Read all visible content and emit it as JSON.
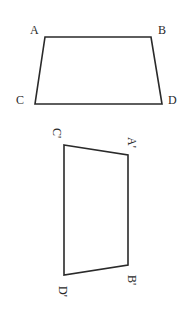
{
  "figure_top": {
    "shape": "trapezoid",
    "stroke_color": "#2a2a2a",
    "vertices": {
      "A": {
        "label": "A",
        "x": 45,
        "y": 37,
        "label_x": 30,
        "label_y": 34
      },
      "B": {
        "label": "B",
        "x": 151,
        "y": 37,
        "label_x": 158,
        "label_y": 34
      },
      "C": {
        "label": "C",
        "x": 35,
        "y": 104,
        "label_x": 16,
        "label_y": 104
      },
      "D": {
        "label": "D",
        "x": 162,
        "y": 104,
        "label_x": 168,
        "label_y": 104
      }
    }
  },
  "figure_bottom": {
    "shape": "trapezoid-rotated",
    "stroke_color": "#2a2a2a",
    "label_rotation_deg": 90,
    "vertices": {
      "C_prime": {
        "label": "C'",
        "x": 64,
        "y": 145,
        "label_x": 53,
        "label_y": 128
      },
      "A_prime": {
        "label": "A'",
        "x": 128,
        "y": 155,
        "label_x": 128,
        "label_y": 137
      },
      "B_prime": {
        "label": "B'",
        "x": 128,
        "y": 265,
        "label_x": 128,
        "label_y": 275
      },
      "D_prime": {
        "label": "D'",
        "x": 64,
        "y": 275,
        "label_x": 59,
        "label_y": 286
      }
    }
  }
}
